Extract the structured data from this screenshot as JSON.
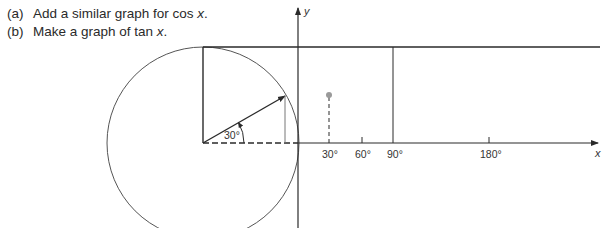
{
  "instructions": [
    {
      "marker": "(a)",
      "text": "Add a similar graph for cos ",
      "var": "x",
      "end": "."
    },
    {
      "marker": "(b)",
      "text": "Make a graph of tan ",
      "var": "x",
      "end": "."
    }
  ],
  "diagram": {
    "y_axis_label": "y",
    "x_axis_label": "x",
    "angle_label": "30°",
    "x_ticks": [
      {
        "label": "30°",
        "x": 329
      },
      {
        "label": "60°",
        "x": 362
      },
      {
        "label": "90°",
        "x": 393
      },
      {
        "label": "180°",
        "x": 489
      }
    ],
    "colors": {
      "ink": "#2a2a2a",
      "point": "#9a9a9a",
      "circle": "#555555"
    }
  }
}
